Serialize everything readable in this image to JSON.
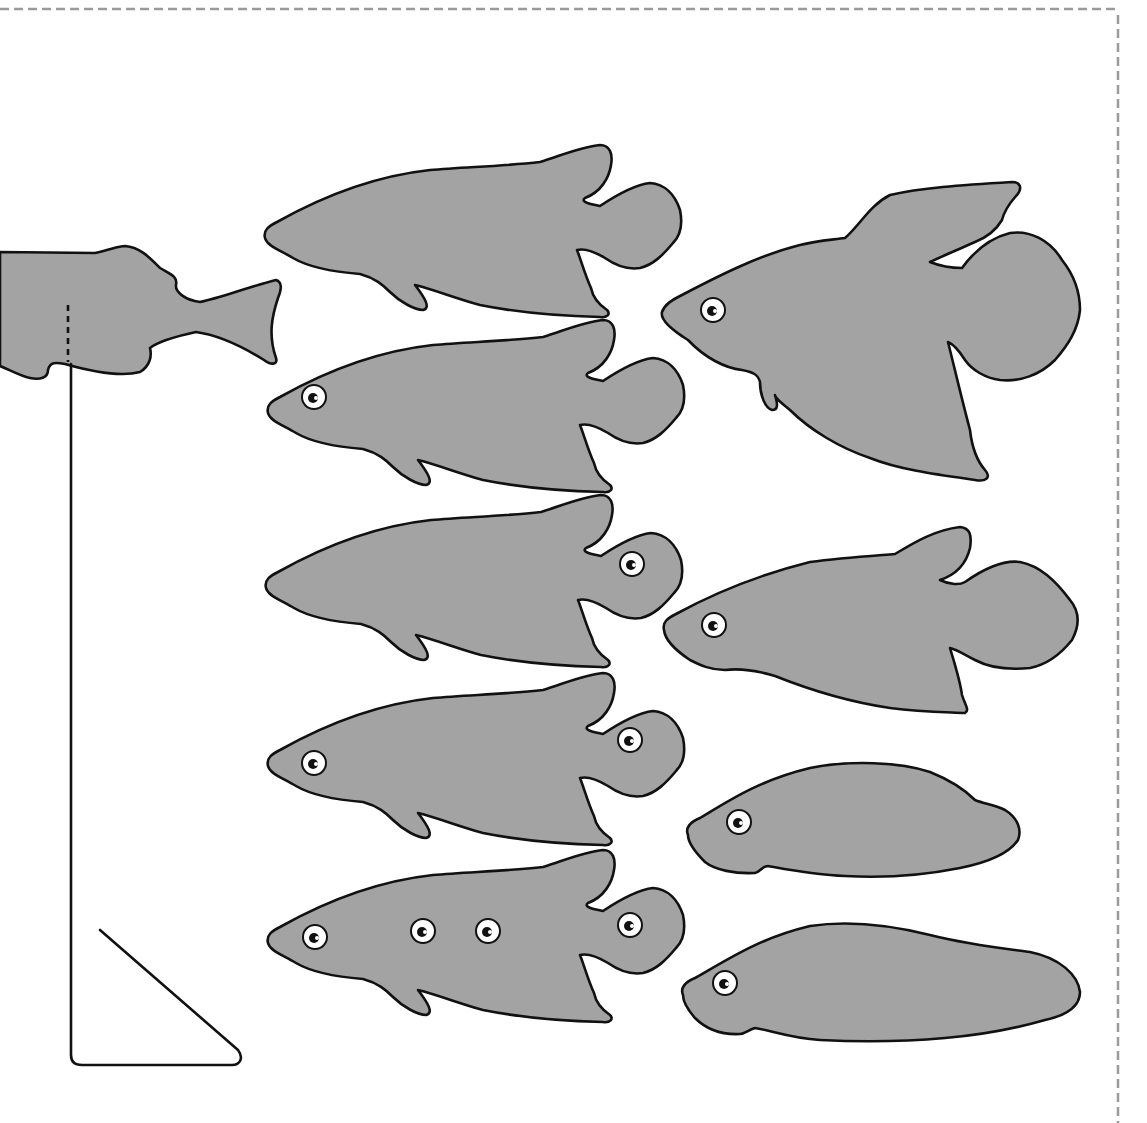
{
  "figure": {
    "type": "fish-silhouette-illustration",
    "background": "#ffffff",
    "fish_fill": "#a3a3a3",
    "outline_color": "#111111",
    "border": {
      "style": "dashed",
      "color": "#9a9a9a",
      "sides": [
        "top",
        "right"
      ]
    }
  },
  "fish": [
    {
      "id": "cut-off-left",
      "shape": "partial-tail-fish",
      "eyes": 0,
      "note": "partially off left edge with dashed cut line"
    },
    {
      "id": "left-col-1",
      "shape": "round-tail-fish",
      "eyes": 0
    },
    {
      "id": "left-col-2",
      "shape": "round-tail-fish",
      "eyes": 1,
      "eye_positions": [
        "head"
      ]
    },
    {
      "id": "left-col-3",
      "shape": "round-tail-fish",
      "eyes": 1,
      "eye_positions": [
        "tail"
      ]
    },
    {
      "id": "left-col-4",
      "shape": "round-tail-fish",
      "eyes": 2,
      "eye_positions": [
        "head",
        "tail"
      ]
    },
    {
      "id": "left-col-5",
      "shape": "round-tail-fish",
      "eyes": 4,
      "eye_positions": [
        "head",
        "mid-body",
        "mid-body",
        "tail"
      ]
    },
    {
      "id": "right-col-1",
      "shape": "betta-long-fin-fish",
      "eyes": 1,
      "eye_positions": [
        "head"
      ]
    },
    {
      "id": "right-col-2",
      "shape": "round-tail-fish",
      "eyes": 1,
      "eye_positions": [
        "head"
      ]
    },
    {
      "id": "right-col-3",
      "shape": "finless-oval-fish",
      "eyes": 1,
      "eye_positions": [
        "head"
      ]
    },
    {
      "id": "right-col-4",
      "shape": "finless-elongated-fish",
      "eyes": 1,
      "eye_positions": [
        "head"
      ]
    }
  ],
  "stand": {
    "shape": "right-triangle-bracket",
    "stroke": "#111111"
  },
  "labels": []
}
